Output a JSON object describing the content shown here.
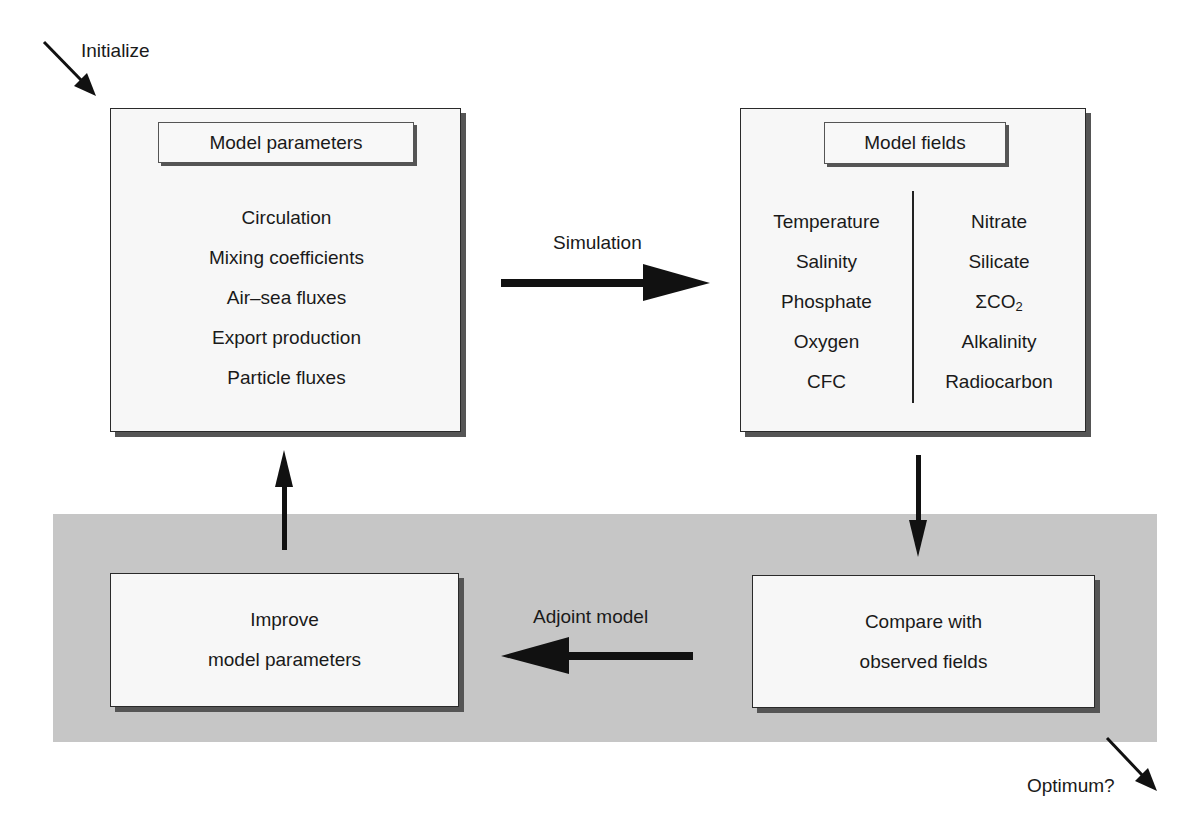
{
  "labels": {
    "initialize": "Initialize",
    "simulation": "Simulation",
    "adjoint_model": "Adjoint model",
    "optimum": "Optimum?"
  },
  "model_parameters_box": {
    "title": "Model parameters",
    "items": [
      "Circulation",
      "Mixing coefficients",
      "Air–sea fluxes",
      "Export production",
      "Particle fluxes"
    ]
  },
  "model_fields_box": {
    "title": "Model fields",
    "left_column": [
      "Temperature",
      "Salinity",
      "Phosphate",
      "Oxygen",
      "CFC"
    ],
    "right_column": [
      "Nitrate",
      "Silicate",
      "ΣCO",
      "Alkalinity",
      "Radiocarbon"
    ],
    "right_column_subscripts": [
      "",
      "",
      "2",
      "",
      ""
    ]
  },
  "improve_box": {
    "line1": "Improve",
    "line2": "model parameters"
  },
  "compare_box": {
    "line1": "Compare with",
    "line2": "observed fields"
  },
  "colors": {
    "band": "#c6c6c6",
    "box_fill": "#f7f7f7",
    "shadow": "#555555",
    "arrow": "#111111"
  }
}
